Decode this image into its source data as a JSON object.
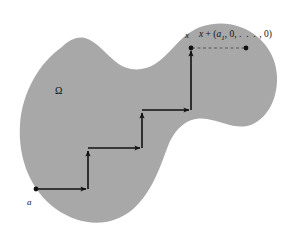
{
  "figure": {
    "domain_label": "Ω",
    "start_label": "a",
    "endpoint_label": "x",
    "shifted_point_label_parts": {
      "x": "x",
      "plus": " + (",
      "a": "a",
      "sub": "1",
      "rest": ", 0, ",
      "dots": ". . .",
      "tail": " , 0)"
    },
    "shifted_point_label_plain": "x + (a1, 0, . . . , 0)",
    "colors": {
      "region_fill": "#a8a8a8",
      "path_stroke": "#111111",
      "background": "#ffffff",
      "dashed_stroke": "#555555"
    },
    "region_outline_path": "M 62 47 C 40 62, 22 92, 20 125 C 18 158, 30 190, 56 209 C 80 226, 110 228, 132 210 C 152 193, 160 167, 168 146 C 176 126, 190 116, 207 119 C 224 122, 238 131, 253 124 C 268 117, 278 98, 277 76 C 276 54, 262 36, 243 28 C 224 20, 203 23, 189 33 C 176 42, 168 56, 155 64 C 142 72, 127 71, 116 62 C 105 53, 96 41, 85 38 C 76 36, 68 41, 62 47 Z",
    "staircase_points": [
      {
        "x": 36,
        "y": 189,
        "name": "start-point-a"
      },
      {
        "x": 88,
        "y": 189,
        "name": "corner-1"
      },
      {
        "x": 88,
        "y": 148,
        "name": "corner-2"
      },
      {
        "x": 142,
        "y": 148,
        "name": "corner-3"
      },
      {
        "x": 142,
        "y": 110,
        "name": "corner-4"
      },
      {
        "x": 191,
        "y": 110,
        "name": "corner-5"
      },
      {
        "x": 191,
        "y": 48,
        "name": "end-point-x"
      }
    ],
    "dashed_segment": {
      "x1": 191,
      "y1": 48,
      "x2": 246,
      "y2": 48
    },
    "dots_on_path": [
      {
        "x": 36,
        "y": 189
      },
      {
        "x": 191,
        "y": 48
      },
      {
        "x": 246,
        "y": 48
      }
    ]
  }
}
